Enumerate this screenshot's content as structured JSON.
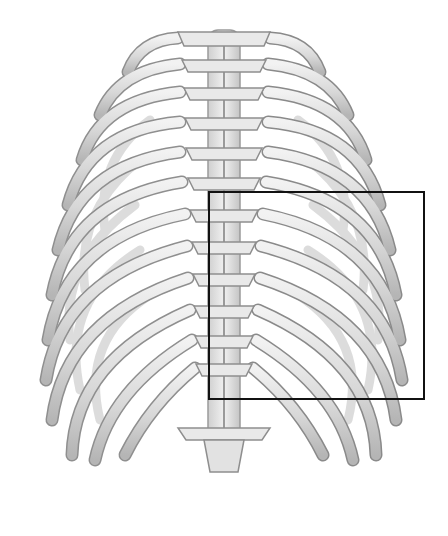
{
  "figure": {
    "background": "#ffffff",
    "bone_fill": "#e6e6e6",
    "bone_shade": "#bdbdbd",
    "bone_outline": "#8c8c8c",
    "canvas": {
      "width": 448,
      "height": 536
    }
  },
  "highlight": {
    "label": "highlighted region",
    "color": "#111111",
    "x": 208,
    "y": 191,
    "width": 217,
    "height": 209
  }
}
